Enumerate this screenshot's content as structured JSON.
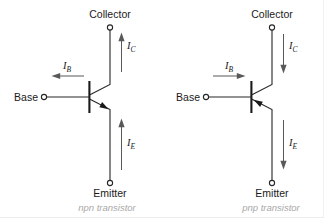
{
  "figure": {
    "title": "",
    "background": "#ffffff",
    "wire_color": "#262626",
    "current_color": "#595959",
    "caption_color": "#a8a8a8"
  },
  "transistors": [
    {
      "id": "npn",
      "caption": "npn transistor",
      "type_prefix": "npn",
      "type_suffix": " transistor",
      "terminals": {
        "collector": "Collector",
        "base": "Base",
        "emitter": "Emitter"
      },
      "currents": [
        {
          "name": "collector-current",
          "symbol": "I",
          "subscript": "C",
          "direction": "up"
        },
        {
          "name": "base-current",
          "symbol": "I",
          "subscript": "B",
          "direction": "left"
        },
        {
          "name": "emitter-current",
          "symbol": "I",
          "subscript": "E",
          "direction": "up"
        }
      ],
      "emitter_arrow": "outward"
    },
    {
      "id": "pnp",
      "caption": "pnp transistor",
      "type_prefix": "pnp",
      "type_suffix": " transistor",
      "terminals": {
        "collector": "Collector",
        "base": "Base",
        "emitter": "Emitter"
      },
      "currents": [
        {
          "name": "collector-current",
          "symbol": "I",
          "subscript": "C",
          "direction": "down"
        },
        {
          "name": "base-current",
          "symbol": "I",
          "subscript": "B",
          "direction": "right"
        },
        {
          "name": "emitter-current",
          "symbol": "I",
          "subscript": "E",
          "direction": "down"
        }
      ],
      "emitter_arrow": "inward"
    }
  ]
}
